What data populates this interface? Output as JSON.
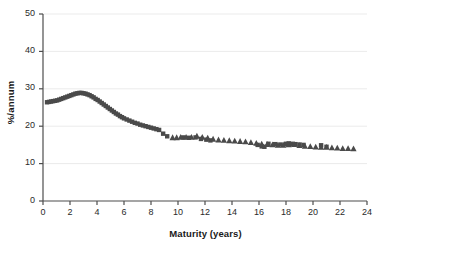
{
  "chart_data": {
    "type": "scatter",
    "title": "",
    "xlabel": "Maturity (years)",
    "ylabel": "%/annum",
    "xlim": [
      0,
      24
    ],
    "ylim": [
      0,
      50
    ],
    "xticks": [
      0,
      2,
      4,
      6,
      8,
      10,
      12,
      14,
      16,
      18,
      20,
      22,
      24
    ],
    "yticks": [
      0,
      10,
      20,
      30,
      40,
      50
    ],
    "grid": "horizontal",
    "legend": "none",
    "marker_color": "#4a4a4a",
    "grid_color": "#ebebeb",
    "axis_color": "#4d4d4d",
    "series": [
      {
        "name": "square-series",
        "marker": "square",
        "points": [
          [
            0.3,
            26.4
          ],
          [
            0.45,
            26.5
          ],
          [
            0.6,
            26.6
          ],
          [
            0.75,
            26.7
          ],
          [
            0.9,
            26.8
          ],
          [
            1.05,
            26.9
          ],
          [
            1.2,
            27.1
          ],
          [
            1.35,
            27.3
          ],
          [
            1.5,
            27.5
          ],
          [
            1.65,
            27.7
          ],
          [
            1.8,
            27.9
          ],
          [
            1.95,
            28.1
          ],
          [
            2.1,
            28.3
          ],
          [
            2.25,
            28.5
          ],
          [
            2.4,
            28.7
          ],
          [
            2.55,
            28.8
          ],
          [
            2.7,
            28.9
          ],
          [
            2.85,
            28.9
          ],
          [
            3.0,
            28.8
          ],
          [
            3.15,
            28.7
          ],
          [
            3.3,
            28.5
          ],
          [
            3.45,
            28.3
          ],
          [
            3.6,
            28.0
          ],
          [
            3.75,
            27.7
          ],
          [
            3.9,
            27.3
          ],
          [
            4.05,
            27.0
          ],
          [
            4.2,
            26.6
          ],
          [
            4.35,
            26.2
          ],
          [
            4.5,
            25.8
          ],
          [
            4.65,
            25.4
          ],
          [
            4.8,
            25.0
          ],
          [
            4.95,
            24.6
          ],
          [
            5.1,
            24.2
          ],
          [
            5.25,
            23.8
          ],
          [
            5.4,
            23.4
          ],
          [
            5.55,
            23.1
          ],
          [
            5.7,
            22.7
          ],
          [
            5.85,
            22.4
          ],
          [
            6.0,
            22.1
          ],
          [
            6.2,
            21.8
          ],
          [
            6.4,
            21.5
          ],
          [
            6.6,
            21.2
          ],
          [
            6.8,
            20.9
          ],
          [
            7.0,
            20.7
          ],
          [
            7.2,
            20.4
          ],
          [
            7.4,
            20.2
          ],
          [
            7.6,
            20.0
          ],
          [
            7.8,
            19.8
          ],
          [
            8.0,
            19.6
          ],
          [
            8.2,
            19.4
          ],
          [
            8.4,
            19.2
          ],
          [
            8.6,
            19.0
          ],
          [
            8.9,
            18.0
          ],
          [
            9.2,
            17.3
          ],
          [
            10.4,
            17.0
          ],
          [
            10.8,
            16.9
          ],
          [
            11.3,
            17.0
          ],
          [
            11.7,
            16.6
          ],
          [
            12.1,
            16.4
          ],
          [
            12.4,
            16.2
          ],
          [
            15.9,
            15.0
          ],
          [
            16.2,
            14.6
          ],
          [
            16.4,
            14.5
          ],
          [
            16.7,
            15.3
          ],
          [
            17.2,
            15.2
          ],
          [
            17.6,
            15.1
          ],
          [
            18.0,
            15.3
          ],
          [
            18.2,
            15.4
          ],
          [
            18.4,
            15.3
          ],
          [
            18.7,
            15.2
          ],
          [
            19.0,
            15.1
          ],
          [
            19.3,
            15.0
          ],
          [
            20.6,
            14.9
          ],
          [
            21.0,
            14.5
          ]
        ]
      },
      {
        "name": "triangle-series",
        "marker": "triangle",
        "points": [
          [
            9.6,
            16.9
          ],
          [
            9.9,
            16.9
          ],
          [
            10.2,
            17.0
          ],
          [
            10.6,
            17.0
          ],
          [
            11.0,
            17.0
          ],
          [
            11.4,
            17.3
          ],
          [
            11.8,
            17.0
          ],
          [
            12.2,
            16.8
          ],
          [
            12.6,
            16.5
          ],
          [
            13.0,
            16.3
          ],
          [
            13.4,
            16.2
          ],
          [
            13.8,
            16.1
          ],
          [
            14.2,
            16.0
          ],
          [
            14.6,
            15.9
          ],
          [
            15.0,
            15.8
          ],
          [
            15.4,
            15.6
          ],
          [
            15.8,
            15.4
          ],
          [
            16.2,
            15.2
          ],
          [
            16.6,
            15.1
          ],
          [
            17.0,
            15.0
          ],
          [
            17.4,
            14.9
          ],
          [
            17.8,
            14.9
          ],
          [
            18.2,
            15.0
          ],
          [
            18.6,
            15.1
          ],
          [
            19.0,
            14.8
          ],
          [
            19.4,
            14.6
          ],
          [
            19.8,
            14.5
          ],
          [
            20.2,
            14.4
          ],
          [
            20.6,
            14.3
          ],
          [
            21.0,
            14.3
          ],
          [
            21.4,
            14.2
          ],
          [
            21.8,
            14.1
          ],
          [
            22.2,
            14.0
          ],
          [
            22.6,
            14.0
          ],
          [
            23.0,
            13.9
          ]
        ]
      }
    ]
  },
  "footer": {
    "text": ""
  }
}
